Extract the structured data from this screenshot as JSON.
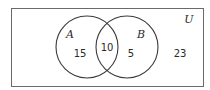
{
  "diagram": {
    "type": "venn",
    "universe_label": "U",
    "sets": [
      {
        "label": "A",
        "only_count": "15"
      },
      {
        "label": "B",
        "only_count": "5"
      }
    ],
    "intersection_count": "10",
    "outside_count": "23",
    "colors": {
      "stroke": "#3a3a3a",
      "text": "#2a2a2a",
      "background": "#ffffff"
    }
  }
}
